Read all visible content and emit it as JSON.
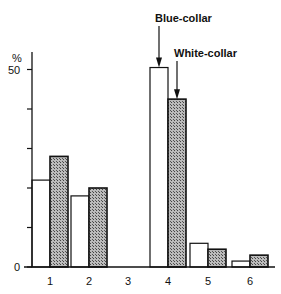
{
  "chart_data": {
    "type": "bar",
    "title": "",
    "xlabel": "",
    "ylabel": "%",
    "ylim": [
      0,
      50
    ],
    "y_ticks": [
      0,
      10,
      20,
      30,
      40,
      50
    ],
    "y_tick_labels": [
      "0",
      "50"
    ],
    "categories": [
      "1",
      "2",
      "3",
      "4",
      "5",
      "6"
    ],
    "series": [
      {
        "name": "Blue-collar",
        "style": "white",
        "values": [
          22,
          18,
          0,
          50.5,
          6,
          1.5
        ]
      },
      {
        "name": "White-collar",
        "style": "hatched",
        "values": [
          28,
          20,
          0,
          42.5,
          4.5,
          3
        ]
      }
    ],
    "annotations": [
      {
        "text": "Blue-collar",
        "points_to": {
          "category": "4",
          "series": "Blue-collar"
        }
      },
      {
        "text": "White-collar",
        "points_to": {
          "category": "4",
          "series": "White-collar"
        }
      }
    ],
    "grid": false,
    "legend": "annotations with arrows"
  },
  "axis": {
    "unit_label": "%",
    "label_top": "50",
    "label_zero": "0"
  }
}
